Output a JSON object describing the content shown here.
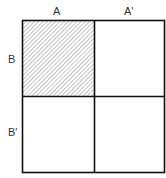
{
  "diagram": {
    "column_labels": [
      "A",
      "A'"
    ],
    "row_labels": [
      "B",
      "B'"
    ],
    "cells": [
      {
        "row": "B",
        "col": "A",
        "shaded": true
      },
      {
        "row": "B",
        "col": "A'",
        "shaded": false
      },
      {
        "row": "B'",
        "col": "A",
        "shaded": false
      },
      {
        "row": "B'",
        "col": "A'",
        "shaded": false
      }
    ],
    "colors": {
      "line": "#111111",
      "hatch": "#888888",
      "background": "#ffffff"
    }
  }
}
